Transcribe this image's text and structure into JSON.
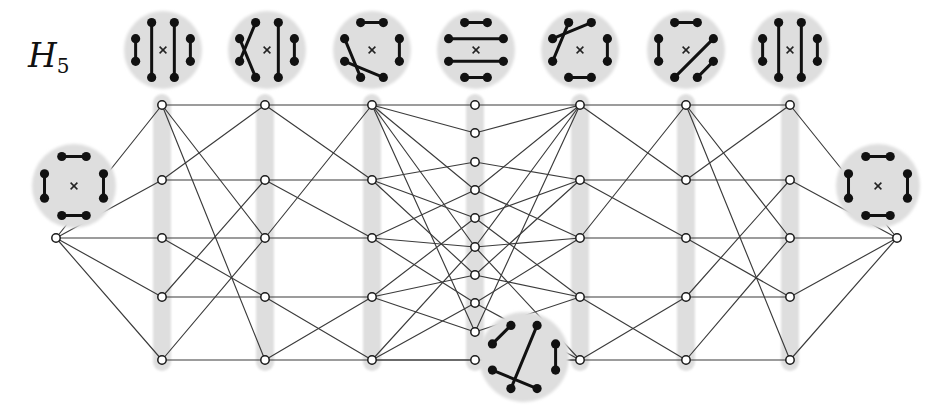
{
  "figure": {
    "label": "H",
    "label_subscript": "5",
    "label_x": 28,
    "label_y": 36,
    "width": 951,
    "height": 411,
    "background": "#ffffff",
    "edge_color": "#3b3b3b",
    "node_stroke": "#1a1a1a",
    "node_fill": "#ffffff",
    "band_color": "#d9d9d9",
    "disk_fill": "#dedede",
    "chord_color": "#111111",
    "point_color": "#111111",
    "cross_color": "#222222"
  },
  "chart_data": {
    "type": "diagram",
    "columns": [
      {
        "id": "L",
        "x": 56,
        "count": 1,
        "ys": [
          238
        ]
      },
      {
        "id": "C1",
        "x": 162,
        "count": 5,
        "ys": [
          105,
          180,
          238,
          297,
          360
        ]
      },
      {
        "id": "C2",
        "x": 265,
        "count": 5,
        "ys": [
          105,
          180,
          238,
          297,
          360
        ]
      },
      {
        "id": "C3",
        "x": 372,
        "count": 5,
        "ys": [
          105,
          180,
          238,
          297,
          360
        ]
      },
      {
        "id": "C4",
        "x": 475,
        "count": 10,
        "ys": [
          105,
          133,
          162,
          190,
          218,
          247,
          275,
          303,
          332,
          360
        ]
      },
      {
        "id": "C5",
        "x": 580,
        "count": 5,
        "ys": [
          105,
          180,
          238,
          297,
          360
        ]
      },
      {
        "id": "C6",
        "x": 686,
        "count": 5,
        "ys": [
          105,
          180,
          238,
          297,
          360
        ]
      },
      {
        "id": "C7",
        "x": 790,
        "count": 5,
        "ys": [
          105,
          180,
          238,
          297,
          360
        ]
      },
      {
        "id": "R",
        "x": 897,
        "count": 1,
        "ys": [
          238
        ]
      }
    ],
    "row_count_outer": 5,
    "row_count_center": 10,
    "column_count": 7,
    "matching_points": 8,
    "chords_per_diagram": 4,
    "disks": [
      {
        "name": "disk-top-1",
        "cx": 163,
        "cy": 50,
        "r": 39,
        "cross": true,
        "chords": [
          [
            1,
            2
          ],
          [
            0,
            3
          ],
          [
            7,
            4
          ],
          [
            6,
            5
          ]
        ]
      },
      {
        "name": "disk-top-2",
        "cx": 267,
        "cy": 50,
        "r": 39,
        "cross": true,
        "chords": [
          [
            1,
            2
          ],
          [
            0,
            3
          ],
          [
            7,
            5
          ],
          [
            6,
            4
          ]
        ]
      },
      {
        "name": "disk-top-3",
        "cx": 372,
        "cy": 50,
        "r": 39,
        "cross": true,
        "chords": [
          [
            1,
            2
          ],
          [
            0,
            7
          ],
          [
            3,
            5
          ],
          [
            6,
            4
          ]
        ]
      },
      {
        "name": "disk-top-4",
        "cx": 476,
        "cy": 50,
        "r": 39,
        "cross": true,
        "chords": [
          [
            1,
            6
          ],
          [
            2,
            5
          ],
          [
            0,
            7
          ],
          [
            3,
            4
          ]
        ]
      },
      {
        "name": "disk-top-5",
        "cx": 580,
        "cy": 50,
        "r": 39,
        "cross": true,
        "chords": [
          [
            1,
            2
          ],
          [
            0,
            6
          ],
          [
            7,
            5
          ],
          [
            3,
            4
          ]
        ]
      },
      {
        "name": "disk-top-6",
        "cx": 686,
        "cy": 50,
        "r": 39,
        "cross": true,
        "chords": [
          [
            1,
            4
          ],
          [
            0,
            7
          ],
          [
            2,
            3
          ],
          [
            5,
            6
          ]
        ]
      },
      {
        "name": "disk-top-7",
        "cx": 790,
        "cy": 50,
        "r": 39,
        "cross": true,
        "chords": [
          [
            1,
            2
          ],
          [
            0,
            3
          ],
          [
            7,
            4
          ],
          [
            6,
            5
          ]
        ]
      },
      {
        "name": "disk-left",
        "cx": 74,
        "cy": 186,
        "r": 42,
        "cross": true,
        "chords": [
          [
            1,
            2
          ],
          [
            0,
            7
          ],
          [
            3,
            4
          ],
          [
            5,
            6
          ]
        ]
      },
      {
        "name": "disk-right",
        "cx": 878,
        "cy": 186,
        "r": 42,
        "cross": true,
        "chords": [
          [
            1,
            2
          ],
          [
            0,
            7
          ],
          [
            3,
            4
          ],
          [
            5,
            6
          ]
        ]
      },
      {
        "name": "disk-bottom",
        "cx": 524,
        "cy": 357,
        "r": 45,
        "cross": false,
        "chords": [
          [
            1,
            2
          ],
          [
            0,
            4
          ],
          [
            7,
            6
          ],
          [
            3,
            5
          ]
        ]
      }
    ],
    "edges_note": "Each outer column vertex links rightwards; the centre column fans to many crossing edges."
  },
  "legend": {
    "node_shape": "open-circle",
    "band_shape": "vertical-rounded-band",
    "disk_shape": "filled-grey-disk"
  }
}
